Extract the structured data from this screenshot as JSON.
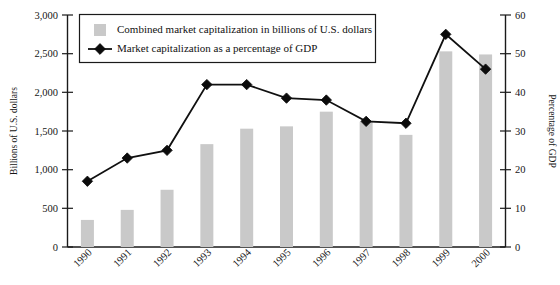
{
  "chart_data": {
    "type": "bar",
    "title": "",
    "subtitle": "",
    "categories": [
      "1990",
      "1991",
      "1992",
      "1993",
      "1994",
      "1995",
      "1996",
      "1997",
      "1998",
      "1999",
      "2000"
    ],
    "series": [
      {
        "name": "Combined market capitalization in billions of U.S. dollars",
        "type": "bar",
        "axis": "left",
        "color": "#c9c9c9",
        "values": [
          350,
          480,
          740,
          1330,
          1530,
          1560,
          1750,
          1620,
          1450,
          2530,
          2490
        ]
      },
      {
        "name": "Market capitalization as a percentage of GDP",
        "type": "line",
        "axis": "right",
        "color": "#101010",
        "marker": "diamond",
        "values": [
          17,
          23,
          25,
          42,
          42,
          38.5,
          38,
          32.5,
          32,
          55,
          46
        ]
      }
    ],
    "xlabel": "",
    "ylabel": "Billions of U.S. dollars",
    "y2label": "Percentage of GDP",
    "ylim": [
      0,
      3000
    ],
    "y2lim": [
      0,
      60
    ],
    "yticks": [
      "0",
      "500",
      "1,000",
      "1,500",
      "2,000",
      "2,500",
      "3,000"
    ],
    "ytick_values": [
      0,
      500,
      1000,
      1500,
      2000,
      2500,
      3000
    ],
    "y2ticks": [
      "0",
      "10",
      "20",
      "30",
      "40",
      "50",
      "60"
    ],
    "y2tick_values": [
      0,
      10,
      20,
      30,
      40,
      50,
      60
    ],
    "grid": false,
    "legend_position": "top-left-inside",
    "legend": [
      {
        "label": "Combined market capitalization in billions of U.S. dollars",
        "marker": "square-swatch",
        "color": "#c9c9c9"
      },
      {
        "label": "Market capitalization as a percentage of GDP",
        "marker": "line-with-diamond",
        "color": "#101010"
      }
    ]
  }
}
